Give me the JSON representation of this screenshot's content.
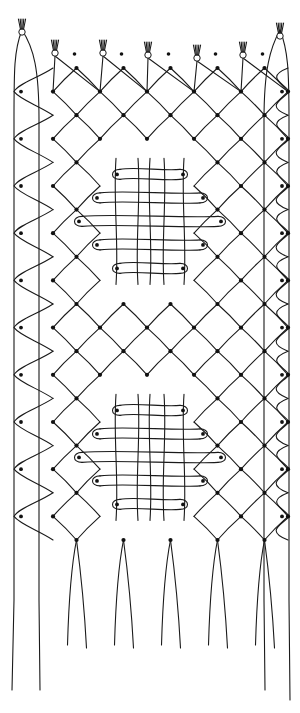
{
  "figure": {
    "ink_color": "#1a1a1a",
    "background": "#ffffff"
  },
  "pattern": {
    "hanging_loops": 7,
    "mesh_columns": 6,
    "mesh_rows": 21,
    "motifs": [
      {
        "name": "upper-ladder",
        "start_row": 4,
        "end_row": 9
      },
      {
        "name": "lower-ladder",
        "start_row": 14,
        "end_row": 19
      }
    ],
    "side_loops_per_edge": 11,
    "fringe_strands": 12
  }
}
